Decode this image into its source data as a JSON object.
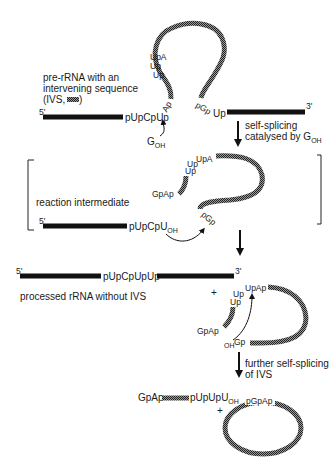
{
  "diagram": {
    "colors": {
      "rna": "#111111",
      "ivs": "#555555",
      "background": "#ffffff"
    },
    "stage1": {
      "label_lines": [
        "pre-rRNA with an",
        "intervening sequence",
        "(IVS, "
      ],
      "label_close": ")",
      "five_prime": "5'",
      "three_prime": "3'",
      "left_seq": "pUpCpUp",
      "left_junction": "Ap",
      "right_junction": "pGp",
      "right_seq": "Up",
      "stem_labels": [
        "UpA",
        "Up",
        "Up"
      ],
      "nucleophile": "G",
      "nucleophile_sub": "OH"
    },
    "step1": {
      "lines": [
        "self-splicing",
        "catalysed by G"
      ],
      "sub": "OH"
    },
    "stage2": {
      "label": "reaction intermediate",
      "five_prime": "5'",
      "left_seq": "pUpCpU",
      "left_seq_sub": "OH",
      "right_end": "pGp",
      "top_labels": [
        "Up",
        "UpA"
      ],
      "stem_label": "Up",
      "cap_label": "GpAp"
    },
    "stage3": {
      "label": "processed rRNA without IVS",
      "five_prime": "5'",
      "three_prime": "3'",
      "joined_seq": "pUpCpUpUp",
      "plus": "+",
      "top_labels": [
        "Up",
        "UpAp"
      ],
      "stem_label": "Up",
      "cap_label": "GpAp",
      "end_label": "Gp",
      "end_prefix": "OH"
    },
    "step2": {
      "lines": [
        "further self-splicing",
        "of IVS"
      ]
    },
    "stage4": {
      "fragment_left": "GpAp",
      "fragment_right": "pUpUpU",
      "fragment_sub": "OH",
      "plus": "+",
      "circle_label": "pGpAp"
    }
  }
}
